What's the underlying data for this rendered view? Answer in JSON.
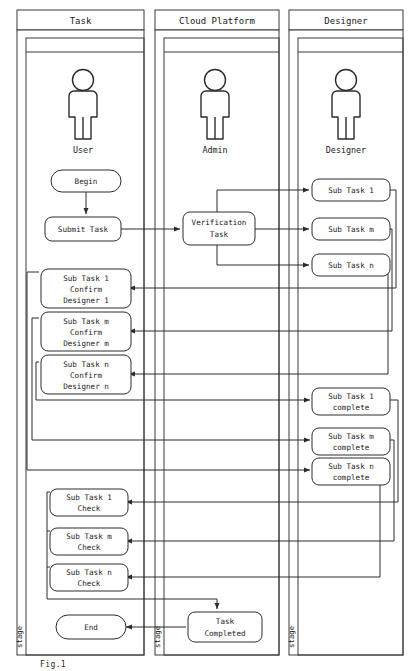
{
  "diagram": {
    "type": "swimlane-flowchart",
    "stage_label": "stage",
    "lanes": [
      {
        "id": "task",
        "title": "Task",
        "actor": "User",
        "actor_icon": "person-icon"
      },
      {
        "id": "cloud-platform",
        "title": "Cloud Platform",
        "actor": "Admin",
        "actor_icon": "person-icon"
      },
      {
        "id": "designer",
        "title": "Designer",
        "actor": "Designer",
        "actor_icon": "person-icon"
      }
    ],
    "nodes": {
      "begin": {
        "lines": [
          "Begin"
        ],
        "shape": "stadium",
        "lane": "task"
      },
      "submit_task": {
        "lines": [
          "Submit Task"
        ],
        "shape": "rounded",
        "lane": "task"
      },
      "verification_task": {
        "lines": [
          "Verification",
          "Task"
        ],
        "shape": "rounded",
        "lane": "cloud-platform"
      },
      "sub_task_1": {
        "lines": [
          "Sub Task 1"
        ],
        "shape": "rounded",
        "lane": "designer"
      },
      "sub_task_m": {
        "lines": [
          "Sub Task m"
        ],
        "shape": "rounded",
        "lane": "designer"
      },
      "sub_task_n": {
        "lines": [
          "Sub Task n"
        ],
        "shape": "rounded",
        "lane": "designer"
      },
      "confirm_1": {
        "lines": [
          "Sub Task 1",
          "Confirm",
          "Designer 1"
        ],
        "shape": "rounded",
        "lane": "task"
      },
      "confirm_m": {
        "lines": [
          "Sub Task m",
          "Confirm",
          "Designer m"
        ],
        "shape": "rounded",
        "lane": "task"
      },
      "confirm_n": {
        "lines": [
          "Sub Task n",
          "Confirm",
          "Designer n"
        ],
        "shape": "rounded",
        "lane": "task"
      },
      "complete_1": {
        "lines": [
          "Sub Task 1",
          "complete"
        ],
        "shape": "rounded",
        "lane": "designer"
      },
      "complete_m": {
        "lines": [
          "Sub Task m",
          "complete"
        ],
        "shape": "rounded",
        "lane": "designer"
      },
      "complete_n": {
        "lines": [
          "Sub Task n",
          "complete"
        ],
        "shape": "rounded",
        "lane": "designer"
      },
      "check_1": {
        "lines": [
          "Sub Task 1",
          "Check"
        ],
        "shape": "rounded",
        "lane": "task"
      },
      "check_m": {
        "lines": [
          "Sub Task m",
          "Check"
        ],
        "shape": "rounded",
        "lane": "task"
      },
      "check_n": {
        "lines": [
          "Sub Task n",
          "Check"
        ],
        "shape": "rounded",
        "lane": "task"
      },
      "task_completed": {
        "lines": [
          "Task",
          "Completed"
        ],
        "shape": "rounded",
        "lane": "cloud-platform"
      },
      "end": {
        "lines": [
          "End"
        ],
        "shape": "stadium",
        "lane": "task"
      }
    },
    "edges": [
      {
        "from": "begin",
        "to": "submit_task"
      },
      {
        "from": "submit_task",
        "to": "verification_task"
      },
      {
        "from": "verification_task",
        "to": "sub_task_1"
      },
      {
        "from": "verification_task",
        "to": "sub_task_m"
      },
      {
        "from": "verification_task",
        "to": "sub_task_n"
      },
      {
        "from": "sub_task_1",
        "to": "confirm_1"
      },
      {
        "from": "sub_task_m",
        "to": "confirm_m"
      },
      {
        "from": "sub_task_n",
        "to": "confirm_n"
      },
      {
        "from": "confirm_1",
        "to": "complete_1"
      },
      {
        "from": "confirm_m",
        "to": "complete_m"
      },
      {
        "from": "confirm_n",
        "to": "complete_n"
      },
      {
        "from": "complete_1",
        "to": "check_1"
      },
      {
        "from": "complete_m",
        "to": "check_m"
      },
      {
        "from": "complete_n",
        "to": "check_n"
      },
      {
        "from": "check_n",
        "to": "task_completed"
      },
      {
        "from": "task_completed",
        "to": "end"
      }
    ],
    "colors": {
      "stroke": "#2c2c2c",
      "lane_stroke": "#3a3a3a",
      "background": "#ffffff"
    }
  },
  "caption": "Fig.1"
}
